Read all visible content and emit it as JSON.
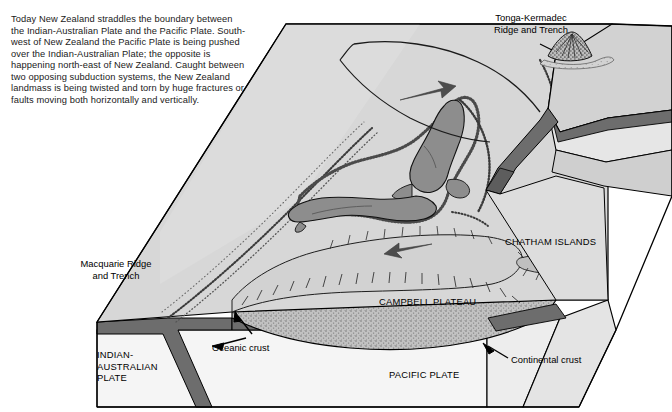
{
  "figure": {
    "type": "geological-block-diagram",
    "intro_paragraph": "Today New Zealand straddles the boundary between the Indian-Australian Plate and the Pacific Plate. South-west of New Zealand the Pacific Plate is being pushed over the Indian-Australian Plate; the opposite is happening north-east of New Zealand. Caught between two opposing subduction systems, the New Zealand landmass is being twisted and torn by huge fractures or faults moving both horizontally and vertically."
  },
  "labels": {
    "tonga": "Tonga-Kermadec\nRidge and Trench",
    "macquarie": "Macquarie Ridge\nand Trench",
    "chatham": "CHATHAM ISLANDS",
    "campbell": "CAMPBELL PLATEAU",
    "pacific_plate": "PACIFIC PLATE",
    "indian_plate": "INDIAN-\nAUSTRALIAN\nPLATE",
    "oceanic_crust": "Oceanic crust",
    "continental_crust": "Continental crust"
  },
  "colors": {
    "top_surface": "#d7d7d7",
    "seafloor_shallow": "#cfcfcf",
    "landmass": "#8d8d8d",
    "plateau_stipple": "#b4b4b4",
    "crust_band": "#6d6d6d",
    "front_face": "#f3f3f3",
    "outline": "#000000",
    "paper": "#ffffff"
  },
  "annotations": {
    "motion_arrows": [
      {
        "name": "arrow-northeast",
        "direction": "north-east",
        "x": 425,
        "y": 92
      },
      {
        "name": "arrow-southwest",
        "direction": "south-west",
        "x": 415,
        "y": 248
      }
    ],
    "volcano": {
      "name": "tonga-kermadec-volcano",
      "x": 566,
      "y": 40
    }
  }
}
